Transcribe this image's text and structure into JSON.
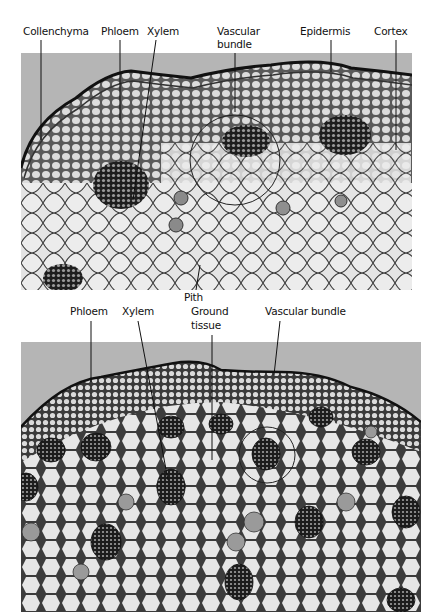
{
  "figure": {
    "top_panel": {
      "description": "Cross-section of a dicot stem (micrograph)",
      "background_color": "#b5b5b5",
      "labels": [
        {
          "id": "collenchyma",
          "text": "Collenchyma"
        },
        {
          "id": "phloem",
          "text": "Phloem"
        },
        {
          "id": "xylem",
          "text": "Xylem"
        },
        {
          "id": "vascular-bundle-l1",
          "text": "Vascular"
        },
        {
          "id": "vascular-bundle-l2",
          "text": "bundle"
        },
        {
          "id": "epidermis",
          "text": "Epidermis"
        },
        {
          "id": "cortex",
          "text": "Cortex"
        },
        {
          "id": "pith",
          "text": "Pith"
        }
      ]
    },
    "bottom_panel": {
      "description": "Cross-section of a monocot stem (micrograph)",
      "background_color": "#b5b5b5",
      "labels": [
        {
          "id": "phloem",
          "text": "Phloem"
        },
        {
          "id": "xylem",
          "text": "Xylem"
        },
        {
          "id": "ground-tissue-l1",
          "text": "Ground"
        },
        {
          "id": "ground-tissue-l2",
          "text": "tissue"
        },
        {
          "id": "vascular-bundle",
          "text": "Vascular bundle"
        }
      ]
    }
  }
}
